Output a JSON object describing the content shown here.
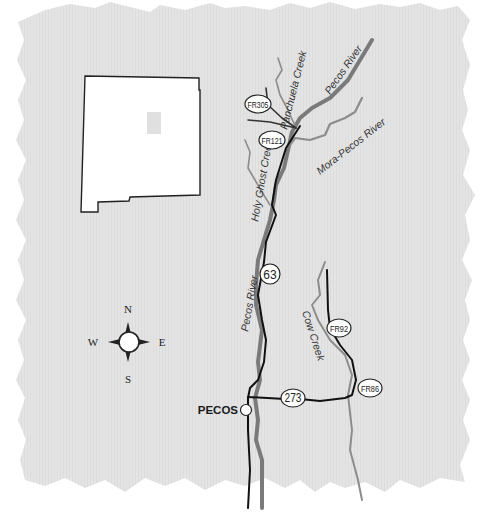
{
  "map": {
    "colors": {
      "paper": "#e4e4e4",
      "river": "#7a7a7a",
      "creek": "#8c8c8c",
      "road": "#111111",
      "shield_fill": "#ffffff",
      "state_fill": "#ffffff",
      "state_marker": "#e0e0e0"
    },
    "inset": {
      "name": "new-mexico-outline",
      "marker": "study-area-marker"
    },
    "rivers": [
      {
        "id": "pecos-river-upper",
        "label": "Pecos River"
      },
      {
        "id": "pecos-river-lower",
        "label": "Pecos River"
      },
      {
        "id": "mora-pecos-river",
        "label": "Mora-Pecos River"
      },
      {
        "id": "panchuela-creek",
        "label": "Panchuela Creek"
      },
      {
        "id": "holy-ghost-creek",
        "label": "Holy Ghost Creek"
      },
      {
        "id": "cow-creek",
        "label": "Cow Creek"
      }
    ],
    "labels": {
      "pecos_river_upper": "Pecos River",
      "pecos_river_lower": "Pecos River",
      "mora_pecos_river": "Mora-Pecos River",
      "panchuela_creek": "Panchuela Creek",
      "holy_ghost_creek": "Holy Ghost Creek",
      "cow_creek": "Cow Creek"
    },
    "shields": {
      "fr305": "FR305",
      "fr121": "FR121",
      "hwy63": "63",
      "fr92": "FR92",
      "fr86": "FR86",
      "hwy273": "273"
    },
    "towns": {
      "pecos": "PECOS"
    },
    "compass": {
      "n": "N",
      "s": "S",
      "e": "E",
      "w": "W"
    }
  }
}
